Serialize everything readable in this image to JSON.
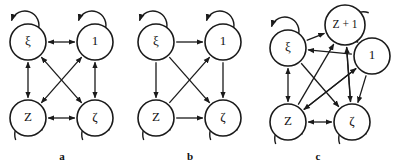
{
  "figure": {
    "background": "#ffffff",
    "stroke_color": "#1a1a1a",
    "width": 397,
    "height": 167,
    "panel_labels": [
      {
        "id": "a",
        "text": "a",
        "x": 62,
        "y": 160
      },
      {
        "id": "b",
        "text": "b",
        "x": 190,
        "y": 160
      },
      {
        "id": "c",
        "text": "c",
        "x": 318,
        "y": 160
      }
    ]
  },
  "chart_data": {
    "type": "diagram",
    "title": "",
    "panels": [
      {
        "id": "a",
        "label": "a",
        "nodes": [
          {
            "id": "xi",
            "label": "ξ",
            "x": 28,
            "y": 42,
            "r": 18,
            "self_loop": "top"
          },
          {
            "id": "one",
            "label": "1",
            "x": 95,
            "y": 42,
            "r": 18,
            "self_loop": "top"
          },
          {
            "id": "Z",
            "label": "Z",
            "x": 28,
            "y": 118,
            "r": 18,
            "self_loop": "bottom"
          },
          {
            "id": "zeta",
            "label": "ζ",
            "x": 95,
            "y": 118,
            "r": 18,
            "self_loop": "bottom"
          }
        ],
        "edges": [
          {
            "from": "xi",
            "to": "one",
            "direction": "both"
          },
          {
            "from": "xi",
            "to": "Z",
            "direction": "both"
          },
          {
            "from": "one",
            "to": "zeta",
            "direction": "both"
          },
          {
            "from": "Z",
            "to": "zeta",
            "direction": "both"
          },
          {
            "from": "xi",
            "to": "zeta",
            "direction": "both"
          },
          {
            "from": "one",
            "to": "Z",
            "direction": "both"
          }
        ]
      },
      {
        "id": "b",
        "label": "b",
        "nodes": [
          {
            "id": "xi",
            "label": "ξ",
            "x": 156,
            "y": 42,
            "r": 18,
            "self_loop": "top"
          },
          {
            "id": "one",
            "label": "1",
            "x": 223,
            "y": 42,
            "r": 18,
            "self_loop": "top"
          },
          {
            "id": "Z",
            "label": "Z",
            "x": 156,
            "y": 118,
            "r": 18,
            "self_loop": "bottom"
          },
          {
            "id": "zeta",
            "label": "ζ",
            "x": 223,
            "y": 118,
            "r": 18,
            "self_loop": "bottom"
          }
        ],
        "edges": [
          {
            "from": "xi",
            "to": "one",
            "direction": "forward"
          },
          {
            "from": "xi",
            "to": "Z",
            "direction": "forward"
          },
          {
            "from": "one",
            "to": "zeta",
            "direction": "forward"
          },
          {
            "from": "Z",
            "to": "zeta",
            "direction": "forward"
          },
          {
            "from": "xi",
            "to": "zeta",
            "direction": "forward"
          },
          {
            "from": "Z",
            "to": "one",
            "direction": "forward"
          }
        ]
      },
      {
        "id": "c",
        "label": "c",
        "nodes": [
          {
            "id": "xi",
            "label": "ξ",
            "x": 288,
            "y": 48,
            "r": 18,
            "self_loop": "top"
          },
          {
            "id": "Zp1",
            "label": "Z + 1",
            "x": 345,
            "y": 25,
            "r": 20,
            "self_loop": "right"
          },
          {
            "id": "one",
            "label": "1",
            "x": 372,
            "y": 56,
            "r": 18,
            "self_loop": "none"
          },
          {
            "id": "Z",
            "label": "Z",
            "x": 288,
            "y": 122,
            "r": 18,
            "self_loop": "bottom"
          },
          {
            "id": "zeta",
            "label": "ζ",
            "x": 352,
            "y": 122,
            "r": 18,
            "self_loop": "bottom"
          }
        ],
        "edges": [
          {
            "from": "xi",
            "to": "Zp1",
            "direction": "forward"
          },
          {
            "from": "xi",
            "to": "Z",
            "direction": "both"
          },
          {
            "from": "Z",
            "to": "zeta",
            "direction": "both"
          },
          {
            "from": "Z",
            "to": "Zp1",
            "direction": "forward"
          },
          {
            "from": "Z",
            "to": "one",
            "direction": "forward"
          },
          {
            "from": "zeta",
            "to": "Zp1",
            "direction": "forward"
          },
          {
            "from": "one",
            "to": "xi",
            "direction": "forward"
          },
          {
            "from": "one",
            "to": "Z",
            "direction": "forward"
          },
          {
            "from": "one",
            "to": "zeta",
            "direction": "forward"
          },
          {
            "from": "Zp1",
            "to": "zeta",
            "direction": "forward"
          },
          {
            "from": "xi",
            "to": "zeta",
            "direction": "forward"
          }
        ]
      }
    ]
  }
}
